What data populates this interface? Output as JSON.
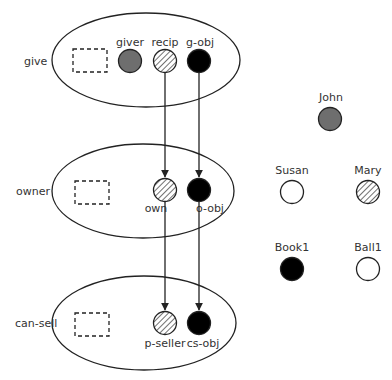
{
  "colors": {
    "stroke": "#222222",
    "gray_fill": "#6e6e6e",
    "black_fill": "#000000",
    "white_fill": "#ffffff",
    "text": "#333333"
  },
  "frames": [
    {
      "name": "give",
      "label": "give",
      "slots": [
        {
          "label": "giver",
          "fill": "gray"
        },
        {
          "label": "recip",
          "fill": "hatched"
        },
        {
          "label": "g-obj",
          "fill": "black"
        }
      ]
    },
    {
      "name": "owner",
      "label": "owner",
      "slots": [
        {
          "label": "own",
          "fill": "hatched"
        },
        {
          "label": "o-obj",
          "fill": "black"
        }
      ]
    },
    {
      "name": "can-sell",
      "label": "can-sell",
      "slots": [
        {
          "label": "p-seller",
          "fill": "hatched"
        },
        {
          "label": "cs-obj",
          "fill": "black"
        }
      ]
    }
  ],
  "entities": [
    {
      "label": "John",
      "fill": "gray"
    },
    {
      "label": "Susan",
      "fill": "white"
    },
    {
      "label": "Mary",
      "fill": "hatched"
    },
    {
      "label": "Book1",
      "fill": "black"
    },
    {
      "label": "Ball1",
      "fill": "white"
    }
  ],
  "bindings": [
    {
      "from": "recip",
      "to": "own"
    },
    {
      "from": "own",
      "to": "p-seller"
    },
    {
      "from": "g-obj",
      "to": "o-obj"
    },
    {
      "from": "o-obj",
      "to": "cs-obj"
    }
  ]
}
